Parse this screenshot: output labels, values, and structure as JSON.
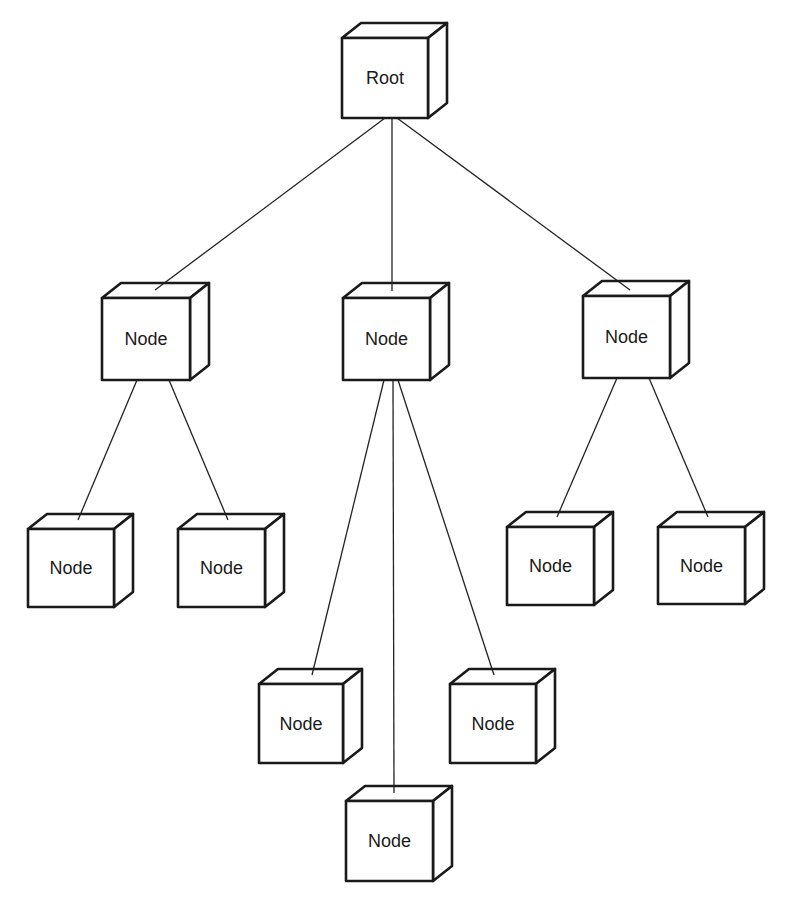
{
  "diagram": {
    "type": "tree",
    "style": {
      "stroke_color": "#1a1a1a",
      "background": "#ffffff",
      "depth_dx": 19,
      "depth_dy": -15
    },
    "nodes": [
      {
        "id": "root",
        "label": "Root",
        "x": 342,
        "y": 38,
        "w": 86,
        "h": 80
      },
      {
        "id": "n1",
        "label": "Node",
        "x": 102,
        "y": 298,
        "w": 88,
        "h": 82
      },
      {
        "id": "n2",
        "label": "Node",
        "x": 343,
        "y": 298,
        "w": 87,
        "h": 82
      },
      {
        "id": "n3",
        "label": "Node",
        "x": 583,
        "y": 296,
        "w": 87,
        "h": 82
      },
      {
        "id": "n1a",
        "label": "Node",
        "x": 28,
        "y": 529,
        "w": 86,
        "h": 78
      },
      {
        "id": "n1b",
        "label": "Node",
        "x": 178,
        "y": 529,
        "w": 87,
        "h": 78
      },
      {
        "id": "n2a",
        "label": "Node",
        "x": 259,
        "y": 684,
        "w": 84,
        "h": 79
      },
      {
        "id": "n2b",
        "label": "Node",
        "x": 346,
        "y": 801,
        "w": 87,
        "h": 80
      },
      {
        "id": "n2c",
        "label": "Node",
        "x": 450,
        "y": 684,
        "w": 86,
        "h": 79
      },
      {
        "id": "n3a",
        "label": "Node",
        "x": 507,
        "y": 527,
        "w": 87,
        "h": 78
      },
      {
        "id": "n3b",
        "label": "Node",
        "x": 658,
        "y": 527,
        "w": 87,
        "h": 77
      }
    ],
    "edges": [
      {
        "from": "root",
        "to": "n1",
        "x1": 385,
        "y1": 118,
        "x2": 155,
        "y2": 290
      },
      {
        "from": "root",
        "to": "n2",
        "x1": 392,
        "y1": 118,
        "x2": 392,
        "y2": 291
      },
      {
        "from": "root",
        "to": "n3",
        "x1": 397,
        "y1": 118,
        "x2": 630,
        "y2": 290
      },
      {
        "from": "n1",
        "to": "n1a",
        "x1": 137,
        "y1": 380,
        "x2": 78,
        "y2": 520
      },
      {
        "from": "n1",
        "to": "n1b",
        "x1": 169,
        "y1": 380,
        "x2": 228,
        "y2": 520
      },
      {
        "from": "n2",
        "to": "n2a",
        "x1": 384,
        "y1": 380,
        "x2": 312,
        "y2": 675
      },
      {
        "from": "n2",
        "to": "n2b",
        "x1": 393,
        "y1": 380,
        "x2": 394,
        "y2": 793
      },
      {
        "from": "n2",
        "to": "n2c",
        "x1": 398,
        "y1": 380,
        "x2": 494,
        "y2": 675
      },
      {
        "from": "n3",
        "to": "n3a",
        "x1": 617,
        "y1": 378,
        "x2": 557,
        "y2": 517
      },
      {
        "from": "n3",
        "to": "n3b",
        "x1": 649,
        "y1": 378,
        "x2": 708,
        "y2": 517
      }
    ]
  }
}
